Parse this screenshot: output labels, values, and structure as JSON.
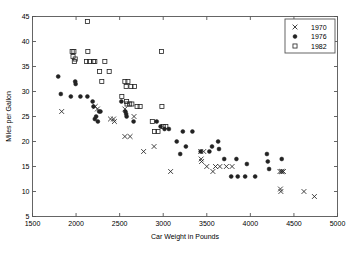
{
  "figure": {
    "background_color": "#ffffff",
    "frame_color": "#555555",
    "marker_color": "#222222"
  },
  "chart_data": {
    "type": "scatter",
    "title": "",
    "xlabel": "Car Weight in Pounds",
    "ylabel": "Miles per Gallon",
    "xlim": [
      1500,
      5000
    ],
    "ylim": [
      5,
      45
    ],
    "xticks": [
      1500,
      2000,
      2500,
      3000,
      3500,
      4000,
      4500,
      5000
    ],
    "yticks": [
      5,
      10,
      15,
      20,
      25,
      30,
      35,
      40,
      45
    ],
    "grid": false,
    "legend_position": "upper right",
    "series": [
      {
        "name": "1970",
        "marker": "x",
        "points": [
          [
            1835,
            26.0
          ],
          [
            2220,
            27.0
          ],
          [
            2245,
            26.5
          ],
          [
            2395,
            24.5
          ],
          [
            2430,
            24.5
          ],
          [
            2440,
            24.0
          ],
          [
            2560,
            26.5
          ],
          [
            2560,
            21.0
          ],
          [
            2620,
            21.0
          ],
          [
            2665,
            25.0
          ],
          [
            2775,
            18.0
          ],
          [
            2895,
            19.0
          ],
          [
            3085,
            14.0
          ],
          [
            3430,
            18.0
          ],
          [
            3435,
            16.5
          ],
          [
            3440,
            16.0
          ],
          [
            3465,
            18.0
          ],
          [
            3500,
            15.0
          ],
          [
            3570,
            14.0
          ],
          [
            3600,
            15.0
          ],
          [
            3650,
            15.0
          ],
          [
            3725,
            15.0
          ],
          [
            3790,
            15.0
          ],
          [
            4340,
            14.0
          ],
          [
            4355,
            14.0
          ],
          [
            4365,
            14.0
          ],
          [
            4380,
            14.0
          ],
          [
            4345,
            10.5
          ],
          [
            4350,
            10.0
          ],
          [
            4615,
            10.0
          ],
          [
            4735,
            9.0
          ]
        ]
      },
      {
        "name": "1976",
        "marker": "o",
        "points": [
          [
            1795,
            33.0
          ],
          [
            1825,
            29.5
          ],
          [
            1940,
            29.0
          ],
          [
            1990,
            32.0
          ],
          [
            1995,
            31.5
          ],
          [
            2050,
            29.0
          ],
          [
            2130,
            29.0
          ],
          [
            2190,
            28.0
          ],
          [
            2200,
            27.0
          ],
          [
            2215,
            24.5
          ],
          [
            2230,
            25.0
          ],
          [
            2250,
            24.0
          ],
          [
            2265,
            26.0
          ],
          [
            2280,
            26.0
          ],
          [
            2520,
            28.0
          ],
          [
            2565,
            26.0
          ],
          [
            2575,
            25.5
          ],
          [
            2580,
            25.0
          ],
          [
            2660,
            24.0
          ],
          [
            2925,
            24.0
          ],
          [
            2970,
            23.0
          ],
          [
            3015,
            22.5
          ],
          [
            3065,
            22.5
          ],
          [
            3155,
            20.0
          ],
          [
            3195,
            17.5
          ],
          [
            3225,
            22.0
          ],
          [
            3335,
            22.0
          ],
          [
            3260,
            19.0
          ],
          [
            3430,
            18.0
          ],
          [
            3530,
            18.0
          ],
          [
            3560,
            19.0
          ],
          [
            3630,
            20.0
          ],
          [
            3640,
            18.5
          ],
          [
            3700,
            16.5
          ],
          [
            3780,
            13.0
          ],
          [
            3840,
            16.5
          ],
          [
            3855,
            13.0
          ],
          [
            3940,
            13.0
          ],
          [
            3960,
            15.5
          ],
          [
            4055,
            13.0
          ],
          [
            4190,
            17.5
          ],
          [
            4200,
            16.0
          ],
          [
            4215,
            14.5
          ],
          [
            4360,
            16.5
          ]
        ]
      },
      {
        "name": "1982",
        "marker": "s",
        "points": [
          [
            2130,
            44.0
          ],
          [
            1955,
            38.0
          ],
          [
            1975,
            38.0
          ],
          [
            1965,
            37.0
          ],
          [
            1990,
            36.5
          ],
          [
            1980,
            36.0
          ],
          [
            2135,
            38.0
          ],
          [
            2120,
            36.0
          ],
          [
            2155,
            36.0
          ],
          [
            2200,
            36.0
          ],
          [
            2215,
            36.0
          ],
          [
            2330,
            36.0
          ],
          [
            2270,
            34.0
          ],
          [
            2380,
            34.0
          ],
          [
            2295,
            32.0
          ],
          [
            2560,
            32.0
          ],
          [
            2595,
            32.0
          ],
          [
            2630,
            31.0
          ],
          [
            2575,
            31.0
          ],
          [
            2670,
            31.0
          ],
          [
            2525,
            29.0
          ],
          [
            2580,
            28.0
          ],
          [
            2585,
            27.5
          ],
          [
            2615,
            27.5
          ],
          [
            2640,
            27.5
          ],
          [
            2700,
            27.0
          ],
          [
            2735,
            27.0
          ],
          [
            2980,
            38.0
          ],
          [
            2985,
            27.0
          ],
          [
            2875,
            24.0
          ],
          [
            2900,
            22.0
          ],
          [
            2940,
            22.0
          ],
          [
            3000,
            23.0
          ],
          [
            3030,
            23.0
          ]
        ]
      }
    ]
  },
  "legend": {
    "entries": [
      {
        "label": "1970",
        "marker": "x"
      },
      {
        "label": "1976",
        "marker": "o"
      },
      {
        "label": "1982",
        "marker": "s"
      }
    ]
  }
}
